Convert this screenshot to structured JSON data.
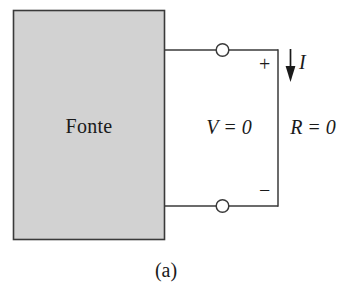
{
  "figure": {
    "caption": "(a)"
  },
  "source_block": {
    "label": "Fonte",
    "fill_color": "#d2d2d2",
    "border_color": "#3a3a3a"
  },
  "labels": {
    "voltage": "V = 0",
    "resistance": "R = 0",
    "current": "I",
    "plus": "+",
    "minus": "−"
  },
  "wire": {
    "color": "#3a3a3a",
    "terminal_fill": "#ffffff"
  },
  "arrow": {
    "direction": "down",
    "color": "#1a1a1a"
  }
}
